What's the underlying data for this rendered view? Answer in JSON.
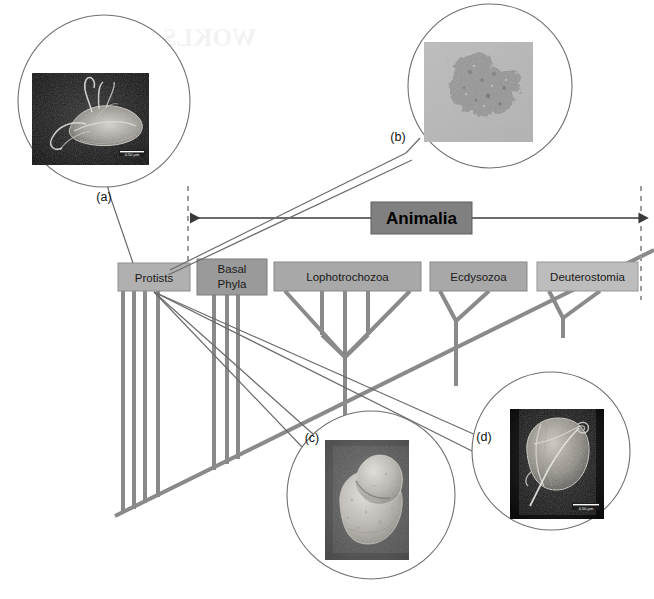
{
  "figure": {
    "background_color": "#ffffff",
    "bleed_through_text": "WOKLS-4uqriq]"
  },
  "clade_bracket": {
    "label": "Animalia",
    "box_fill": "#808080",
    "box_stroke": "#5a5a5a",
    "text_color": "#000000",
    "left_boundary_x": 188,
    "right_boundary_x": 641,
    "arrow_y": 218
  },
  "taxa": [
    {
      "id": "protists",
      "label": "Protists",
      "label_lines": [
        "Protists"
      ],
      "x": 118,
      "y": 263,
      "w": 72,
      "h": 28,
      "fill": "#b0b0b0",
      "stroke": "#8d8d8d",
      "in_animalia": false
    },
    {
      "id": "basal-phyla",
      "label": "Basal Phyla",
      "label_lines": [
        "Basal",
        "Phyla"
      ],
      "x": 197,
      "y": 259,
      "w": 70,
      "h": 36,
      "fill": "#9a9a9a",
      "stroke": "#7d7d7d",
      "in_animalia": true
    },
    {
      "id": "lophotrochozoa",
      "label": "Lophotrochozoa",
      "label_lines": [
        "Lophotrochozoa"
      ],
      "x": 274,
      "y": 262,
      "w": 147,
      "h": 29,
      "fill": "#a8a8a8",
      "stroke": "#888888",
      "in_animalia": true
    },
    {
      "id": "ecdysozoa",
      "label": "Ecdysozoa",
      "label_lines": [
        "Ecdysozoa"
      ],
      "x": 430,
      "y": 262,
      "w": 97,
      "h": 29,
      "fill": "#a8a8a8",
      "stroke": "#888888",
      "in_animalia": true
    },
    {
      "id": "deuterostomia",
      "label": "Deuterostomia",
      "label_lines": [
        "Deuterostomia"
      ],
      "x": 537,
      "y": 262,
      "w": 101,
      "h": 29,
      "fill": "#bdbdbd",
      "stroke": "#959595",
      "in_animalia": true
    }
  ],
  "tree": {
    "line_color": "#8a8a8a",
    "line_width": 4,
    "backbone": {
      "x1": 115,
      "y1": 516,
      "x2": 654,
      "y2": 251
    },
    "note": "Thick gray cladogram branches descend from each taxon box to a long diagonal backbone running from lower-left to upper-right."
  },
  "insets": [
    {
      "id": "a",
      "letter": "(a)",
      "letter_x": 104,
      "letter_y": 201,
      "circle": {
        "cx": 104,
        "cy": 101,
        "r": 86
      },
      "image": {
        "x": 32,
        "y": 73,
        "w": 117,
        "h": 92,
        "style": "dark-sem",
        "subject": "flagellated protist (Giardia-like) with long flagella"
      },
      "scale_bar": "0.50 µm",
      "leader_target": "protists"
    },
    {
      "id": "b",
      "letter": "(b)",
      "letter_x": 398,
      "letter_y": 141,
      "circle": {
        "cx": 490,
        "cy": 86,
        "r": 82
      },
      "image": {
        "x": 424,
        "y": 42,
        "w": 109,
        "h": 100,
        "style": "light-micrograph",
        "subject": "irregular branching cell aggregate on pale gray field"
      },
      "scale_bar": "",
      "leader_target": "protists"
    },
    {
      "id": "c",
      "letter": "(c)",
      "letter_x": 312,
      "letter_y": 442,
      "circle": {
        "cx": 371,
        "cy": 495,
        "r": 84
      },
      "image": {
        "x": 325,
        "y": 440,
        "w": 84,
        "h": 120,
        "style": "dark-sem",
        "subject": "bilobed embryo-like body, granular surface"
      },
      "scale_bar": "",
      "leader_target": "protists"
    },
    {
      "id": "d",
      "letter": "(d)",
      "letter_x": 484,
      "letter_y": 441,
      "circle": {
        "cx": 551,
        "cy": 451,
        "r": 79
      },
      "image": {
        "x": 510,
        "y": 409,
        "w": 94,
        "h": 110,
        "style": "dark-sem",
        "subject": "rounded cell with long trailing flagellum"
      },
      "scale_bar": "0.50 µm",
      "leader_target": "protists"
    }
  ],
  "colors": {
    "tree_line": "#8a8a8a",
    "leader_line": "#6b6b6b",
    "circle_outline": "#6f6f6f",
    "dashed_boundary": "#9b9b9b",
    "arrow": "#3a3a3a",
    "animalia_box": "#808080"
  }
}
